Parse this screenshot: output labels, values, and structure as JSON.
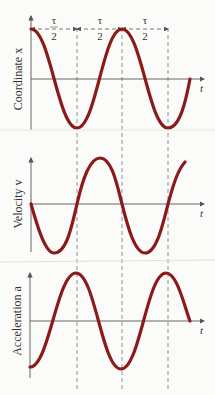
{
  "figure": {
    "panels": [
      {
        "name": "coordinate",
        "ylabel": "Coordinate x",
        "xlabel": "t"
      },
      {
        "name": "velocity",
        "ylabel": "Velocity v",
        "xlabel": "t"
      },
      {
        "name": "acceleration",
        "ylabel": "Acceleration a",
        "xlabel": "t"
      }
    ],
    "period_marks": [
      {
        "num": "τ",
        "den": "2"
      },
      {
        "num": "τ",
        "den": "2"
      },
      {
        "num": "τ",
        "den": "2"
      }
    ],
    "colors": {
      "curve": "#8b1a1a",
      "axis": "#555555",
      "dash": "#777777"
    }
  }
}
